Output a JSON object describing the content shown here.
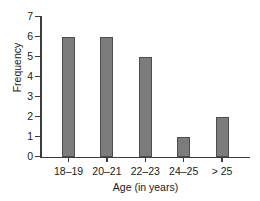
{
  "chart_data": {
    "type": "bar",
    "title": "",
    "categories": [
      "18–19",
      "20–21",
      "22–23",
      "24–25",
      "> 25"
    ],
    "values": [
      6,
      6,
      5,
      1,
      2
    ],
    "xlabel": "Age (in years)",
    "ylabel": "Frequency",
    "ylim": [
      0,
      7
    ],
    "yticks": [
      "0",
      "1",
      "2",
      "3",
      "4",
      "5",
      "6",
      "7"
    ],
    "grid": false,
    "legend": null,
    "bar_color": "#7c7c7c",
    "bar_edge_color": "#4d4d4d",
    "axis_color": "#3c3c3c"
  }
}
